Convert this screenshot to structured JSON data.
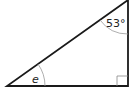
{
  "diagram": {
    "type": "right-triangle",
    "angles": {
      "top_right": {
        "label": "53°",
        "value": 53
      },
      "bottom_left": {
        "label": "e",
        "italic": true
      },
      "bottom_right": {
        "label": "right-angle",
        "value": 90
      }
    },
    "colors": {
      "stroke": "#1a1a1a",
      "arc": "#888888",
      "background": "#ffffff"
    }
  }
}
